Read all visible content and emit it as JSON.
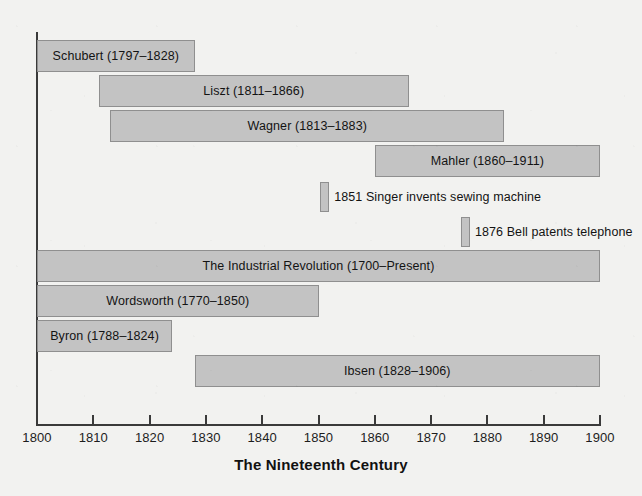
{
  "chart_data": {
    "type": "bar",
    "orientation": "horizontal",
    "title": "",
    "xlabel": "The Nineteenth Century",
    "ylabel": "",
    "xlim": [
      1800,
      1900
    ],
    "x_ticks": [
      1800,
      1810,
      1820,
      1830,
      1840,
      1850,
      1860,
      1870,
      1880,
      1890,
      1900
    ],
    "x_tick_labels": [
      "1800",
      "1810",
      "1820",
      "1830",
      "1840",
      "1850",
      "1860",
      "1870",
      "1880",
      "1890",
      "1900"
    ],
    "grid": false,
    "legend": "none",
    "bar_fill_color": "#c3c3c3",
    "bar_border_color": "#8f8f8f",
    "axis_color": "#3a3a3a",
    "background_color": "#f2f2f0",
    "spans": [
      {
        "label": "Schubert (1797–1828)",
        "start": 1797,
        "end": 1828,
        "row": 0,
        "clipped_start": true
      },
      {
        "label": "Liszt (1811–1866)",
        "start": 1811,
        "end": 1866,
        "row": 1,
        "clipped_start": false
      },
      {
        "label": "Wagner (1813–1883)",
        "start": 1813,
        "end": 1883,
        "row": 2,
        "clipped_start": false
      },
      {
        "label": "Mahler (1860–1911)",
        "start": 1860,
        "end": 1911,
        "row": 3,
        "clipped_start": false
      },
      {
        "label": "The Industrial Revolution (1700–Present)",
        "start": 1700,
        "end": 1900,
        "row": 6,
        "clipped_start": true
      },
      {
        "label": "Wordsworth (1770–1850)",
        "start": 1770,
        "end": 1850,
        "row": 7,
        "clipped_start": true
      },
      {
        "label": "Byron (1788–1824)",
        "start": 1788,
        "end": 1824,
        "row": 8,
        "clipped_start": true
      },
      {
        "label": "Ibsen (1828–1906)",
        "start": 1828,
        "end": 1906,
        "row": 9,
        "clipped_start": false
      }
    ],
    "events": [
      {
        "label": "1851 Singer invents sewing machine",
        "year": 1851,
        "row": 4
      },
      {
        "label": "1876 Bell patents telephone",
        "year": 1876,
        "row": 5
      }
    ]
  },
  "axis": {
    "title": "The Nineteenth Century"
  }
}
